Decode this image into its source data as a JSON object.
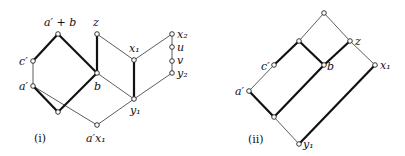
{
  "figure": {
    "panels": [
      {
        "id": "i",
        "caption": "(i)",
        "nodes": {
          "top_ab": {
            "label": "a′ + b",
            "x": 58,
            "y": 34
          },
          "z": {
            "label": "z",
            "x": 97,
            "y": 34
          },
          "x2": {
            "label": "x₂",
            "x": 172,
            "y": 34
          },
          "u": {
            "label": "u",
            "x": 172,
            "y": 47
          },
          "c": {
            "label": "c′",
            "x": 33,
            "y": 61
          },
          "x1": {
            "label": "x₁",
            "x": 134,
            "y": 60
          },
          "v": {
            "label": "v",
            "x": 172,
            "y": 61
          },
          "y2": {
            "label": "y₂",
            "x": 172,
            "y": 73
          },
          "b": {
            "label": "b",
            "x": 97,
            "y": 73
          },
          "a": {
            "label": "a′",
            "x": 33,
            "y": 86
          },
          "y1": {
            "label": "y₁",
            "x": 134,
            "y": 99
          },
          "m": {
            "label": "",
            "x": 58,
            "y": 112
          },
          "ax1": {
            "label": "a′x₁",
            "x": 97,
            "y": 125
          }
        },
        "edges_thick": [
          [
            "top_ab",
            "c"
          ],
          [
            "top_ab",
            "b"
          ],
          [
            "a",
            "m"
          ],
          [
            "m",
            "b"
          ],
          [
            "z",
            "b"
          ],
          [
            "x1",
            "y1"
          ]
        ],
        "edges_thin": [
          [
            "c",
            "a"
          ],
          [
            "a",
            "ax1"
          ],
          [
            "z",
            "x1"
          ],
          [
            "b",
            "y1"
          ],
          [
            "x1",
            "x2"
          ],
          [
            "x2",
            "u"
          ],
          [
            "u",
            "v"
          ],
          [
            "v",
            "y2"
          ],
          [
            "y2",
            "y1"
          ],
          [
            "y1",
            "ax1"
          ]
        ]
      },
      {
        "id": "ii",
        "caption": "(ii)",
        "nodes": {
          "top": {
            "label": "",
            "x": 324,
            "y": 13
          },
          "t2": {
            "label": "",
            "x": 299,
            "y": 41
          },
          "z": {
            "label": "z",
            "x": 350,
            "y": 41
          },
          "c": {
            "label": "c′",
            "x": 274,
            "y": 65
          },
          "b": {
            "label": "b",
            "x": 324,
            "y": 65
          },
          "x1": {
            "label": "x₁",
            "x": 375,
            "y": 65
          },
          "a": {
            "label": "a′",
            "x": 249,
            "y": 91
          },
          "m": {
            "label": "",
            "x": 274,
            "y": 117
          },
          "y1": {
            "label": "y₁",
            "x": 299,
            "y": 144
          }
        },
        "edges_thick": [
          [
            "t2",
            "c"
          ],
          [
            "t2",
            "b"
          ],
          [
            "z",
            "b"
          ],
          [
            "b",
            "m"
          ],
          [
            "a",
            "m"
          ],
          [
            "x1",
            "y1"
          ]
        ],
        "edges_thin": [
          [
            "top",
            "t2"
          ],
          [
            "top",
            "z"
          ],
          [
            "z",
            "x1"
          ],
          [
            "c",
            "a"
          ],
          [
            "m",
            "y1"
          ]
        ]
      }
    ],
    "labels": {
      "i_top_ab": "a′ + b",
      "i_z": "z",
      "i_x2": "x₂",
      "i_u": "u",
      "i_v": "v",
      "i_y2": "y₂",
      "i_x1": "x₁",
      "i_c": "c′",
      "i_a": "a′",
      "i_b": "b",
      "i_y1": "y₁",
      "i_ax1": "a′x₁",
      "i_caption": "(i)",
      "ii_z": "z",
      "ii_c": "c′",
      "ii_b": "b",
      "ii_x1": "x₁",
      "ii_a": "a′",
      "ii_y1": "y₁",
      "ii_caption": "(ii)"
    }
  }
}
